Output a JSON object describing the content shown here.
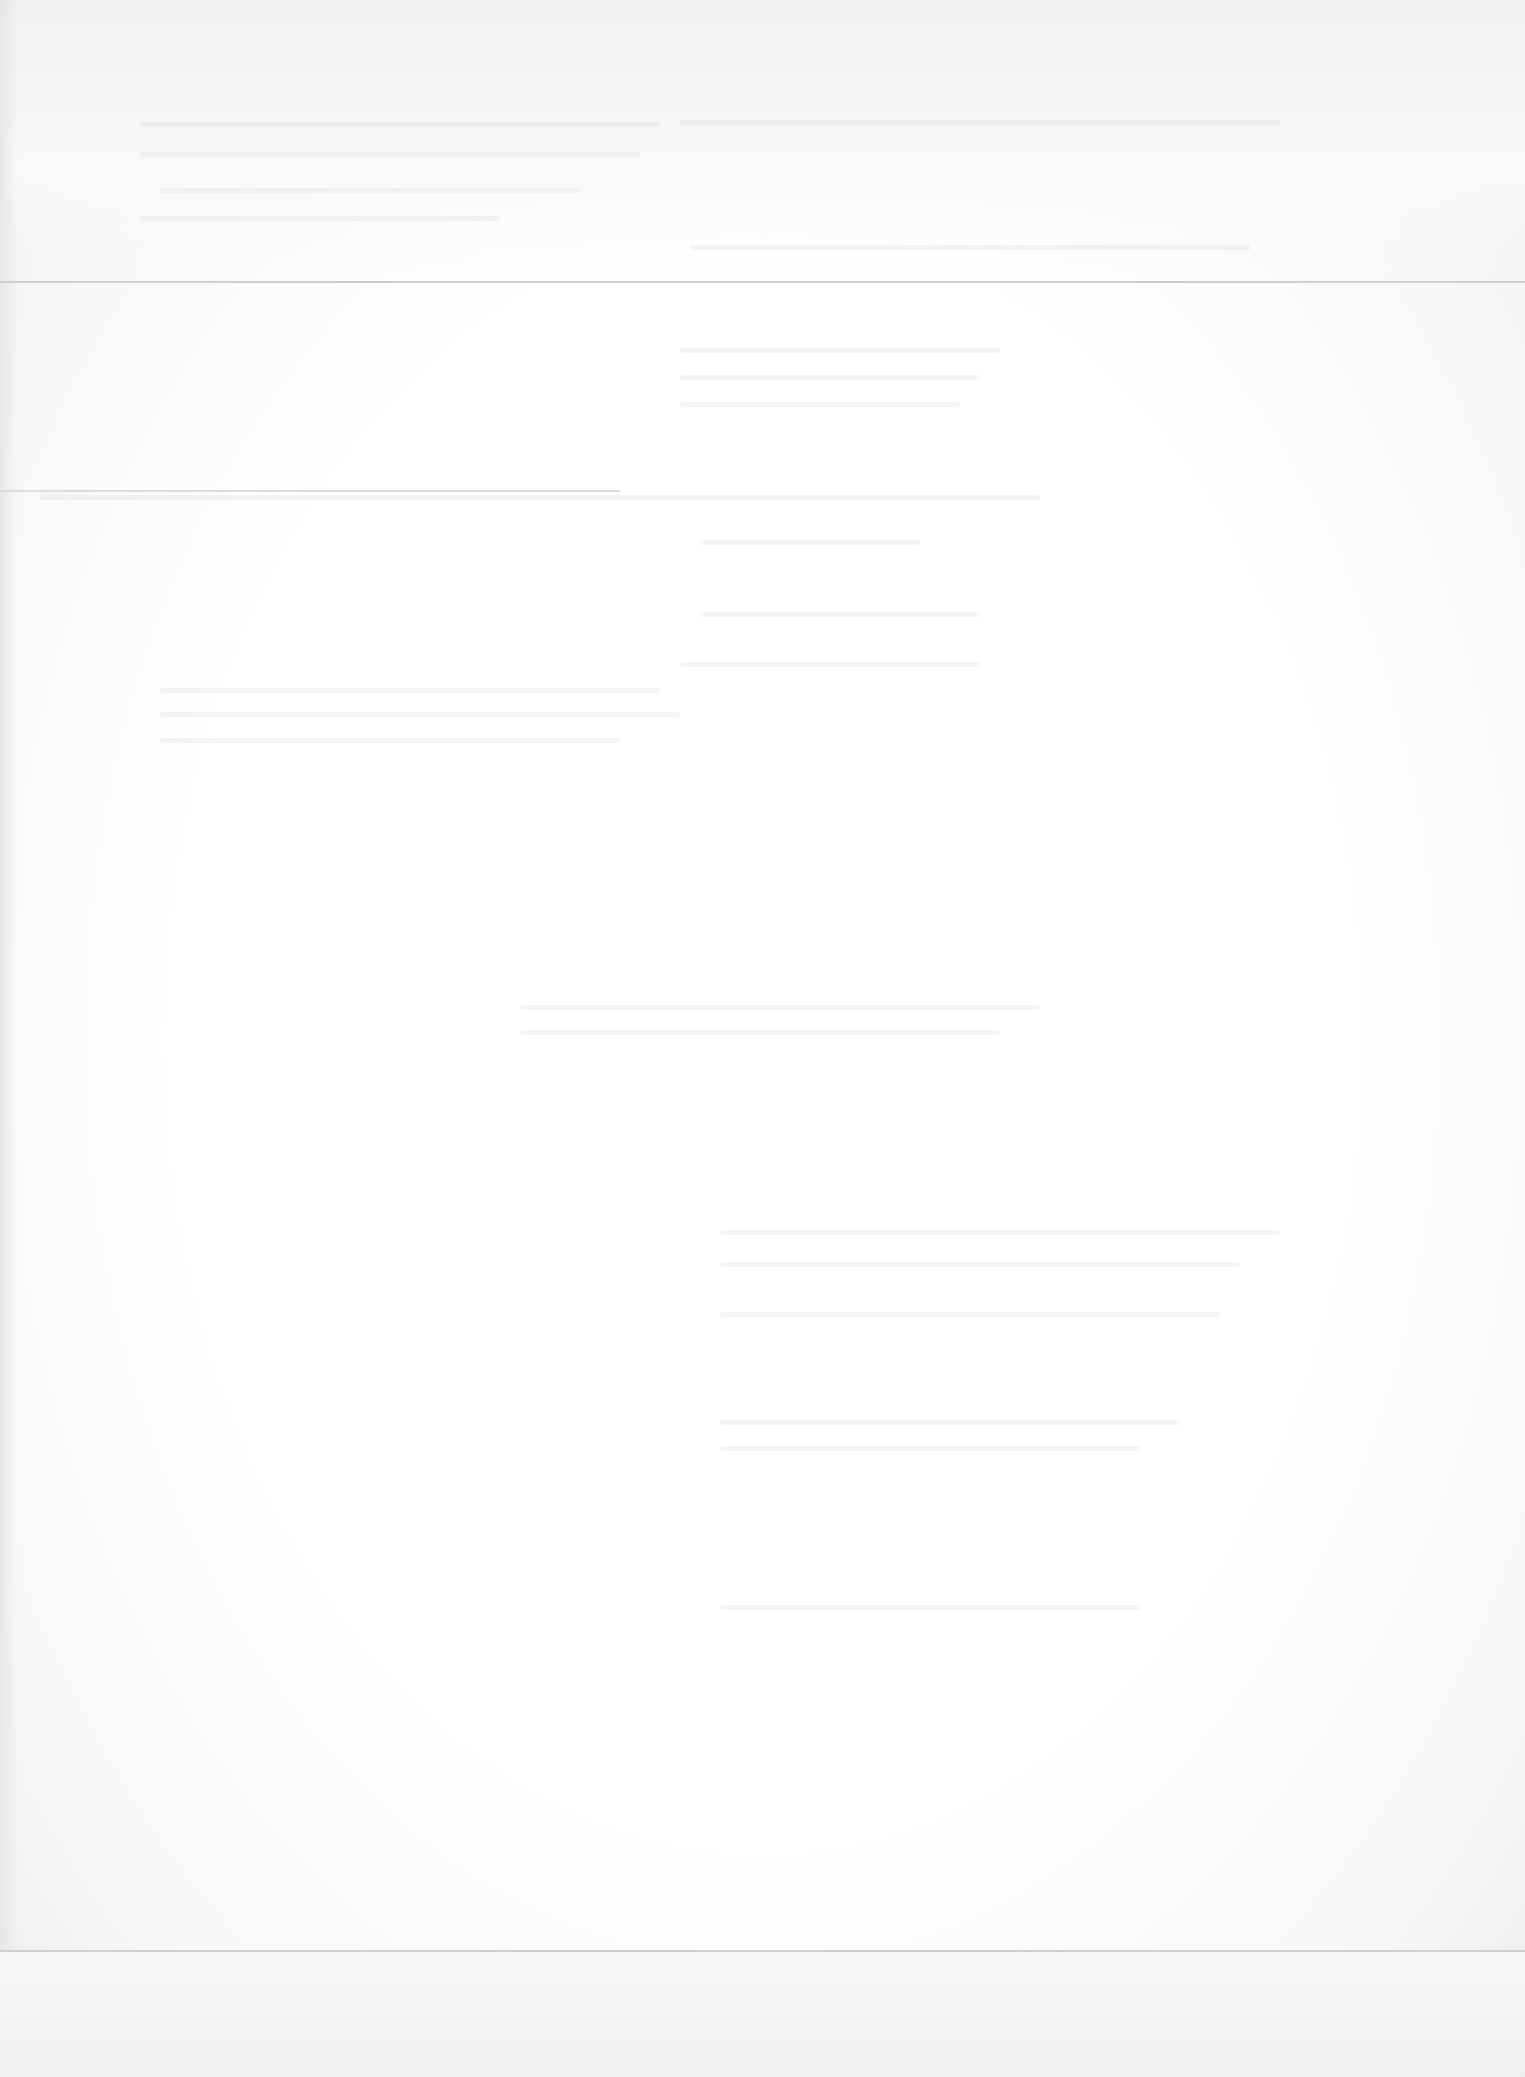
{
  "page": {
    "type": "blank-scanned-page",
    "legible_text": []
  },
  "colors": {
    "paper": "#ffffff",
    "rule": "#cfcfcf"
  }
}
